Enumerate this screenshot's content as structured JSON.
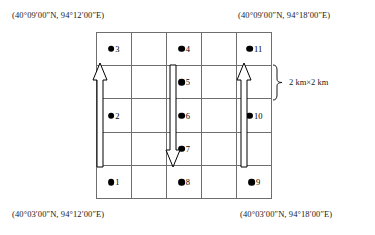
{
  "figure": {
    "type": "sampling-grid-map",
    "grid": {
      "columns": 5,
      "rows": 5
    },
    "corner_coordinates": {
      "top_left": "(40°09′00″N, 94°12′00″E)",
      "top_right": "(40°09′00″N, 94°18′00″E)",
      "bottom_left": "(40°03′00″N, 94°12′00″E)",
      "bottom_right": "(40°03′00″N, 94°18′00″E)"
    },
    "scale": {
      "label": "2 km×2 km",
      "bracket_icon": "curly-brace-right-icon"
    },
    "sample_points": [
      {
        "label": "3",
        "column": 1,
        "row": 1
      },
      {
        "label": "4",
        "column": 3,
        "row": 1
      },
      {
        "label": "11",
        "column": 5,
        "row": 1
      },
      {
        "label": "5",
        "column": 3,
        "row": 2
      },
      {
        "label": "2",
        "column": 1,
        "row": 3
      },
      {
        "label": "6",
        "column": 3,
        "row": 3
      },
      {
        "label": "10",
        "column": 5,
        "row": 3
      },
      {
        "label": "7",
        "column": 3,
        "row": 4
      },
      {
        "label": "1",
        "column": 1,
        "row": 5
      },
      {
        "label": "8",
        "column": 3,
        "row": 5
      },
      {
        "label": "9",
        "column": 5,
        "row": 5
      }
    ],
    "arrows": [
      {
        "name": "arrow-up-left",
        "direction": "up",
        "column": 1
      },
      {
        "name": "arrow-down-middle",
        "direction": "down",
        "column": 3
      },
      {
        "name": "arrow-up-right",
        "direction": "up",
        "column": 5
      }
    ]
  }
}
